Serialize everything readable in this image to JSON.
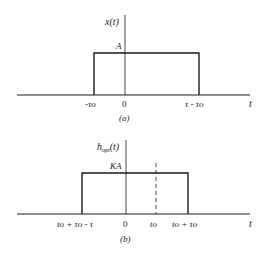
{
  "figure_a": {
    "ylabel": "x(t)",
    "amplitude_label": "A",
    "xlabel": "t",
    "ticks": [
      "-τo",
      "0",
      "τ - τo"
    ],
    "caption": "(a)"
  },
  "figure_b": {
    "ylabel_main": "h",
    "ylabel_sub": "opt",
    "ylabel_tail": "(t)",
    "amplitude_label": "KA",
    "xlabel": "t",
    "ticks": [
      "to + τo - τ",
      "0",
      "to",
      "to + τo"
    ],
    "caption": "(b)"
  },
  "colors": {
    "line": "#1a1a1a",
    "background": "#ffffff"
  }
}
